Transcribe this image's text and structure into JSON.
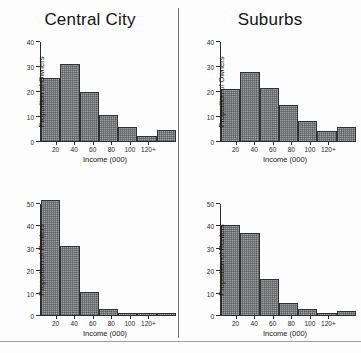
{
  "figure": {
    "name": "income-distribution-histograms",
    "panel_count": 4
  },
  "titles": {
    "left": "Central City",
    "right": "Suburbs"
  },
  "axis": {
    "xlabel": "Income (000)",
    "ylabel_owners": "Proportion of Owners",
    "ylabel_renters": "Proportion of Renters",
    "xticks": [
      "20",
      "40",
      "60",
      "80",
      "100",
      "120+"
    ],
    "yticks_owners": [
      "0",
      "10",
      "20",
      "30",
      "40"
    ],
    "yticks_renters": [
      "0",
      "10",
      "20",
      "30",
      "40",
      "50"
    ]
  },
  "chart_data": [
    {
      "type": "bar",
      "name": "central-city-owners",
      "title": "Central City",
      "xlabel": "Income (000)",
      "ylabel": "Proportion of Owners",
      "categories": [
        "0-20",
        "20-40",
        "40-60",
        "60-80",
        "80-100",
        "100-120",
        "120+"
      ],
      "xtick_labels": [
        "20",
        "40",
        "60",
        "80",
        "100",
        "120+"
      ],
      "values": [
        25.5,
        31,
        20,
        10.5,
        5.5,
        2,
        4.5
      ],
      "ylim": [
        0,
        40
      ],
      "ytick_values": [
        0,
        10,
        20,
        30,
        40
      ],
      "grid": false,
      "legend": false
    },
    {
      "type": "bar",
      "name": "suburbs-owners",
      "title": "Suburbs",
      "xlabel": "Income (000)",
      "ylabel": "Proportion of Owners",
      "categories": [
        "0-20",
        "20-40",
        "40-60",
        "60-80",
        "80-100",
        "100-120",
        "120+"
      ],
      "xtick_labels": [
        "20",
        "40",
        "60",
        "80",
        "100",
        "120+"
      ],
      "values": [
        21,
        28,
        21.5,
        14.5,
        8,
        4,
        5.5
      ],
      "ylim": [
        0,
        40
      ],
      "ytick_values": [
        0,
        10,
        20,
        30,
        40
      ],
      "grid": false,
      "legend": false
    },
    {
      "type": "bar",
      "name": "central-city-renters",
      "title": "Central City",
      "xlabel": "Income (000)",
      "ylabel": "Proportion of Renters",
      "categories": [
        "0-20",
        "20-40",
        "40-60",
        "60-80",
        "80-100",
        "100-120",
        "120+"
      ],
      "xtick_labels": [
        "20",
        "40",
        "60",
        "80",
        "100",
        "120+"
      ],
      "values": [
        52,
        31,
        10.5,
        2.5,
        1,
        1,
        1
      ],
      "ylim": [
        0,
        50
      ],
      "ytick_values": [
        0,
        10,
        20,
        30,
        40,
        50
      ],
      "grid": false,
      "legend": false
    },
    {
      "type": "bar",
      "name": "suburbs-renters",
      "title": "Suburbs",
      "xlabel": "Income (000)",
      "ylabel": "Proportion of Renters",
      "categories": [
        "0-20",
        "20-40",
        "40-60",
        "60-80",
        "80-100",
        "100-120",
        "120+"
      ],
      "xtick_labels": [
        "20",
        "40",
        "60",
        "80",
        "100",
        "120+"
      ],
      "values": [
        40.5,
        37,
        16,
        5.5,
        2.5,
        1,
        2
      ],
      "ylim": [
        0,
        50
      ],
      "ytick_values": [
        0,
        10,
        20,
        30,
        40,
        50
      ],
      "grid": false,
      "legend": false
    }
  ],
  "colors": {
    "bar_fill": "#77787a",
    "bar_stroke": "#303133",
    "axis": "#2a2b2d",
    "divider": "#6e7074",
    "background": "#fdfdfd",
    "text": "#17181a"
  }
}
